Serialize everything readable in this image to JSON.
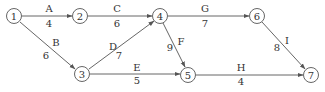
{
  "diagram": {
    "type": "activity-network",
    "nodes": [
      {
        "id": "1",
        "x": 14,
        "y": 16
      },
      {
        "id": "2",
        "x": 80,
        "y": 16
      },
      {
        "id": "3",
        "x": 82,
        "y": 74
      },
      {
        "id": "4",
        "x": 160,
        "y": 16
      },
      {
        "id": "5",
        "x": 188,
        "y": 75
      },
      {
        "id": "6",
        "x": 257,
        "y": 16
      },
      {
        "id": "7",
        "x": 311,
        "y": 75
      }
    ],
    "edges": [
      {
        "from": "1",
        "to": "2",
        "activity": "A",
        "duration": "4"
      },
      {
        "from": "1",
        "to": "3",
        "activity": "B",
        "duration": "6"
      },
      {
        "from": "2",
        "to": "4",
        "activity": "C",
        "duration": "6"
      },
      {
        "from": "3",
        "to": "4",
        "activity": "D",
        "duration": "7"
      },
      {
        "from": "3",
        "to": "5",
        "activity": "E",
        "duration": "5"
      },
      {
        "from": "4",
        "to": "5",
        "activity": "F",
        "duration": "9"
      },
      {
        "from": "4",
        "to": "6",
        "activity": "G",
        "duration": "7"
      },
      {
        "from": "5",
        "to": "7",
        "activity": "H",
        "duration": "4"
      },
      {
        "from": "6",
        "to": "7",
        "activity": "I",
        "duration": "8"
      }
    ]
  }
}
